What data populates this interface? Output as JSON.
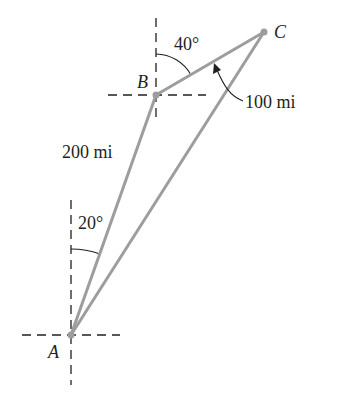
{
  "diagram": {
    "points": {
      "A": {
        "label": "A",
        "x": 71,
        "y": 335
      },
      "B": {
        "label": "B",
        "x": 156,
        "y": 95
      },
      "C": {
        "label": "C",
        "x": 264,
        "y": 32
      }
    },
    "segments": [
      {
        "from": "A",
        "to": "B",
        "label": "200 mi"
      },
      {
        "from": "B",
        "to": "C",
        "label": "100 mi"
      },
      {
        "from": "A",
        "to": "C",
        "label": ""
      }
    ],
    "angles": [
      {
        "at": "A",
        "label": "20°"
      },
      {
        "at": "B",
        "label": "40°"
      }
    ],
    "colors": {
      "line": "#9d9d9d",
      "dashes": "#231f20",
      "text": "#231f20"
    }
  }
}
